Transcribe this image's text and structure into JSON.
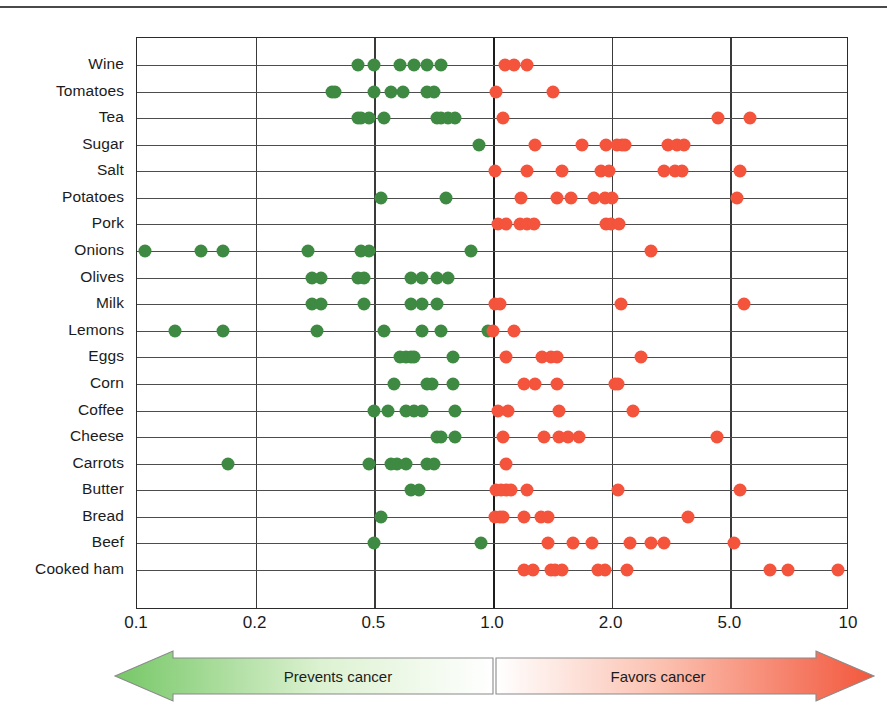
{
  "chart_data": {
    "type": "scatter",
    "title": "",
    "xlabel": "",
    "ylabel": "",
    "orientation": "horizontal",
    "axis_scale": "log-like evenly spaced ticks",
    "xticks": [
      "0.1",
      "0.2",
      "0.5",
      "1.0",
      "2.0",
      "5.0",
      "10"
    ],
    "xtick_positions": [
      0.0,
      0.1667,
      0.3333,
      0.5,
      0.6667,
      0.8333,
      1.0
    ],
    "reference_line": "1.0",
    "grid": "vertical gridlines at each tick; one horizontal rule per category",
    "legend": {
      "position": "below-axis arrow band",
      "entries": [
        {
          "label": "Prevents cancer",
          "color": "#79c36a",
          "side": "left"
        },
        {
          "label": "Favors cancer",
          "color": "#f2573c",
          "side": "right"
        }
      ]
    },
    "series": [
      {
        "name": "Prevents cancer (risk ratio < 1)",
        "color": "#3f8a42",
        "marker": "circle"
      },
      {
        "name": "Favors cancer (risk ratio > 1)",
        "color": "#f4533c",
        "marker": "circle"
      }
    ],
    "categories": [
      "Wine",
      "Tomatoes",
      "Tea",
      "Sugar",
      "Salt",
      "Potatoes",
      "Pork",
      "Onions",
      "Olives",
      "Milk",
      "Lemons",
      "Eggs",
      "Corn",
      "Coffee",
      "Cheese",
      "Carrots",
      "Butter",
      "Bread",
      "Beef",
      "Cooked ham"
    ],
    "rows": [
      {
        "category": "Wine",
        "green": [
          0.44,
          0.5,
          0.58,
          0.63,
          0.68,
          0.74
        ],
        "red": [
          1.07,
          1.13,
          1.22
        ]
      },
      {
        "category": "Tomatoes",
        "green": [
          0.36,
          0.37,
          0.5,
          0.55,
          0.59,
          0.68,
          0.71
        ],
        "red": [
          1.02,
          1.42
        ]
      },
      {
        "category": "Tea",
        "green": [
          0.44,
          0.45,
          0.48,
          0.53,
          0.72,
          0.74,
          0.77,
          0.8
        ],
        "red": [
          1.06,
          4.55,
          5.6
        ]
      },
      {
        "category": "Sugar",
        "green": [
          0.92
        ],
        "red": [
          1.28,
          1.68,
          1.93,
          2.08,
          2.16,
          2.22,
          3.1,
          3.3,
          3.5
        ]
      },
      {
        "category": "Salt",
        "green": [],
        "red": [
          1.01,
          1.22,
          1.5,
          1.88,
          1.97,
          3.0,
          3.25,
          3.45,
          5.3
        ]
      },
      {
        "category": "Potatoes",
        "green": [
          0.52,
          0.76
        ],
        "red": [
          1.18,
          1.45,
          1.58,
          1.8,
          1.92,
          2.0,
          5.2
        ]
      },
      {
        "category": "Pork",
        "green": [],
        "red": [
          1.03,
          1.08,
          1.17,
          1.22,
          1.27,
          1.93,
          1.99,
          2.12
        ]
      },
      {
        "category": "Onions",
        "green": [
          0.105,
          0.145,
          0.165,
          0.3,
          0.45,
          0.48,
          0.88
        ],
        "red": [
          2.7
        ]
      },
      {
        "category": "Olives",
        "green": [
          0.31,
          0.33,
          0.44,
          0.46,
          0.62,
          0.66,
          0.72,
          0.77
        ],
        "red": []
      },
      {
        "category": "Milk",
        "green": [
          0.31,
          0.33,
          0.46,
          0.62,
          0.66,
          0.72
        ],
        "red": [
          1.01,
          1.04,
          2.15,
          5.4
        ]
      },
      {
        "category": "Lemons",
        "green": [
          0.125,
          0.165,
          0.32,
          0.53,
          0.66,
          0.74,
          0.97
        ],
        "red": [
          1.0,
          1.13
        ]
      },
      {
        "category": "Eggs",
        "green": [
          0.58,
          0.6,
          0.62,
          0.63,
          0.79
        ],
        "red": [
          1.08,
          1.33,
          1.4,
          1.45,
          2.5
        ]
      },
      {
        "category": "Corn",
        "green": [
          0.56,
          0.68,
          0.7,
          0.79
        ],
        "red": [
          1.2,
          1.28,
          1.45,
          2.05,
          2.1
        ]
      },
      {
        "category": "Coffee",
        "green": [
          0.5,
          0.54,
          0.6,
          0.63,
          0.66,
          0.8
        ],
        "red": [
          1.03,
          1.09,
          1.47,
          2.35
        ]
      },
      {
        "category": "Cheese",
        "green": [
          0.72,
          0.74,
          0.8
        ],
        "red": [
          1.06,
          1.35,
          1.47,
          1.55,
          1.65,
          4.5
        ]
      },
      {
        "category": "Carrots",
        "green": [
          0.17,
          0.48,
          0.55,
          0.57,
          0.6,
          0.68,
          0.71
        ],
        "red": [
          1.08
        ]
      },
      {
        "category": "Butter",
        "green": [
          0.62,
          0.65
        ],
        "red": [
          1.02,
          1.05,
          1.08,
          1.11,
          1.22,
          2.1,
          5.3
        ]
      },
      {
        "category": "Bread",
        "green": [
          0.52
        ],
        "red": [
          1.01,
          1.04,
          1.06,
          1.2,
          1.32,
          1.38,
          3.6
        ]
      },
      {
        "category": "Beef",
        "green": [
          0.5,
          0.93
        ],
        "red": [
          1.38,
          1.6,
          1.78,
          2.3,
          2.7,
          3.0,
          5.1
        ]
      },
      {
        "category": "Cooked ham",
        "green": [],
        "red": [
          1.2,
          1.26,
          1.4,
          1.44,
          1.5,
          1.85,
          1.92,
          2.25,
          6.3,
          7.0,
          9.4
        ]
      }
    ]
  },
  "axis": {
    "ticks": [
      "0.1",
      "0.2",
      "0.5",
      "1.0",
      "2.0",
      "5.0",
      "10"
    ]
  },
  "arrow_band": {
    "left_label": "Prevents cancer",
    "right_label": "Favors cancer",
    "left_color": "#8fd47c",
    "right_color": "#f2573c"
  }
}
